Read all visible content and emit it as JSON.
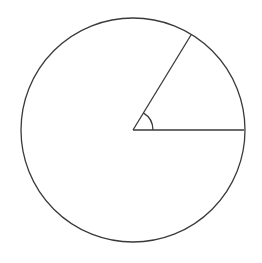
{
  "diagram": {
    "type": "circle-with-central-angle",
    "background": "#ffffff",
    "stroke_color": "#3a3a3a",
    "stroke_width": 1.3,
    "circle": {
      "cx": 133,
      "cy": 130,
      "r": 112
    },
    "radii": [
      {
        "name": "horizontal-radius",
        "x2": 244,
        "y2": 130
      },
      {
        "name": "inclined-radius",
        "x2": 191,
        "y2": 35
      }
    ],
    "angle_marker": {
      "radius": 20,
      "from_deg": 0,
      "to_deg": 59
    },
    "labels": []
  }
}
